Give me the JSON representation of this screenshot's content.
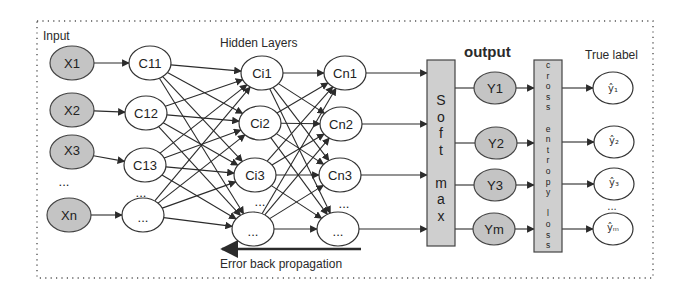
{
  "labels": {
    "input": "Input",
    "hidden_layers": "Hidden Layers",
    "output": "output",
    "true_label": "True label",
    "error_back_propagation": "Error back propagation"
  },
  "colors": {
    "shaded_node": "#c4c4c4",
    "box_fill": "#cfcfcf",
    "stroke": "#2b2b2b",
    "border_dots": "#555555"
  },
  "layers": {
    "input": [
      "X1",
      "X2",
      "X3",
      "...",
      "Xn"
    ],
    "first_hidden": [
      "C11",
      "C12",
      "C13",
      "..."
    ],
    "middle_hidden": [
      "Ci1",
      "Ci2",
      "Ci3",
      "..."
    ],
    "last_hidden": [
      "Cn1",
      "Cn2",
      "Cn3",
      "..."
    ],
    "output": [
      "Y1",
      "Y2",
      "Y3",
      "Ym"
    ],
    "true_labels": [
      "ŷ1",
      "ŷ2",
      "ŷ3",
      "...",
      "ŷm"
    ]
  },
  "node_text": {
    "x1": "X1",
    "x2": "X2",
    "x3": "X3",
    "xn": "Xn",
    "x_ellipsis": "...",
    "c11": "C11",
    "c12": "C12",
    "c13": "C13",
    "c1n": "...",
    "c_ellipsis": "...",
    "ci1": "Ci1",
    "ci2": "Ci2",
    "ci3": "Ci3",
    "cin": "...",
    "ci_ellipsis": "...",
    "cn1": "Cn1",
    "cn2": "Cn2",
    "cn3": "Cn3",
    "cnn": "...",
    "cn_ellipsis": "...",
    "y1": "Y1",
    "y2": "Y2",
    "y3": "Y3",
    "ym": "Ym",
    "yh1": "ŷ₁",
    "yh2": "ŷ₂",
    "yh3": "ŷ₃",
    "yhm": "ŷₘ",
    "yh_ellipsis": "..."
  },
  "softmax_box": {
    "letters": [
      "S",
      "o",
      "f",
      "t",
      "",
      "m",
      "a",
      "x"
    ],
    "label": "Soft max"
  },
  "cross_entropy_box": {
    "letters": [
      "c",
      "r",
      "o",
      "s",
      "s",
      "",
      "e",
      "n",
      "t",
      "r",
      "o",
      "p",
      "y",
      "",
      "l",
      "o",
      "s",
      "s"
    ],
    "label": "cross entropy loss"
  }
}
